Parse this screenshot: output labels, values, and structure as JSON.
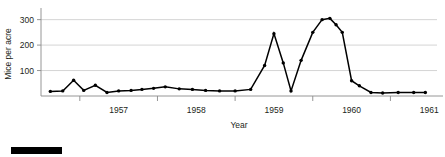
{
  "figure": {
    "caption_bar": "redacted-caption-block"
  },
  "chart_data": {
    "type": "line",
    "title": "",
    "xlabel": "Year",
    "ylabel": "Mice per acre",
    "xlim": [
      1956.5,
      1961.6
    ],
    "ylim": [
      0,
      330
    ],
    "yticks": [
      100,
      200,
      300
    ],
    "xticks": [
      1957,
      1958,
      1959,
      1960,
      1961
    ],
    "xtick_labels": [
      "1957",
      "1958",
      "1959",
      "1960",
      "1961"
    ],
    "ytick_labels": [
      "100",
      "200",
      "300"
    ],
    "grid": "horizontal",
    "legend": "none",
    "series": [
      {
        "name": "Mice per acre",
        "x": [
          1956.62,
          1956.78,
          1956.92,
          1957.05,
          1957.2,
          1957.35,
          1957.5,
          1957.66,
          1957.8,
          1957.95,
          1958.1,
          1958.28,
          1958.45,
          1958.62,
          1958.8,
          1959.0,
          1959.2,
          1959.38,
          1959.5,
          1959.62,
          1959.72,
          1959.85,
          1960.0,
          1960.12,
          1960.22,
          1960.3,
          1960.38,
          1960.5,
          1960.6,
          1960.75,
          1960.9,
          1961.1,
          1961.3,
          1961.45
        ],
        "y": [
          18,
          20,
          62,
          22,
          42,
          14,
          20,
          22,
          26,
          30,
          36,
          28,
          26,
          22,
          20,
          20,
          26,
          120,
          245,
          130,
          20,
          140,
          250,
          300,
          305,
          280,
          250,
          60,
          40,
          14,
          12,
          14,
          14,
          14
        ]
      }
    ]
  }
}
